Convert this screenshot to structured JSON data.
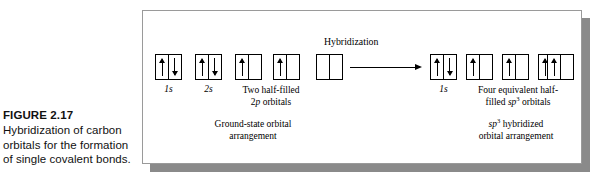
{
  "figure": {
    "number_label": "FIGURE 2.17",
    "caption_line1": "Hybridization of carbon",
    "caption_line2": "orbitals for the formation",
    "caption_line3": "of single covalent bonds."
  },
  "diagram": {
    "process_label": "Hybridization",
    "process_arrow": "right-arrow",
    "left_side": {
      "orbitals": [
        {
          "name": "1s-orbital",
          "label": "1s",
          "left_arrow": "up",
          "right_arrow": "down"
        },
        {
          "name": "2s-orbital",
          "label": "2s",
          "left_arrow": "up",
          "right_arrow": "down"
        },
        {
          "name": "2p-orbital-1",
          "label": "",
          "left_arrow": "up",
          "right_arrow": "none"
        },
        {
          "name": "2p-orbital-2",
          "label": "",
          "left_arrow": "up",
          "right_arrow": "none"
        },
        {
          "name": "2p-orbital-empty",
          "label": "",
          "left_arrow": "none",
          "right_arrow": "none"
        }
      ],
      "label_1s": "1s",
      "label_2s": "2s",
      "p_label_line1": "Two half-filled",
      "p_label_line2": "2p orbitals",
      "p_label_line2_prefix": "2",
      "p_label_line2_italic": "p",
      "p_label_line2_suffix": " orbitals",
      "state_line1": "Ground-state orbital",
      "state_line2": "arrangement"
    },
    "right_side": {
      "orbitals": [
        {
          "name": "1s-orbital",
          "label": "1s",
          "left_arrow": "up",
          "right_arrow": "down"
        },
        {
          "name": "sp3-orbital-1",
          "label": "",
          "left_arrow": "up",
          "right_arrow": "none"
        },
        {
          "name": "sp3-orbital-2",
          "label": "",
          "left_arrow": "up",
          "right_arrow": "none"
        },
        {
          "name": "sp3-orbital-3",
          "label": "",
          "left_arrow": "up",
          "right_arrow": "none"
        },
        {
          "name": "sp3-orbital-4",
          "label": "",
          "left_arrow": "up",
          "right_arrow": "none"
        }
      ],
      "label_1s": "1s",
      "sp3_label_line1": "Four equivalent half-",
      "sp3_label_line2_prefix": "filled ",
      "sp3_label_line2_italic": "sp",
      "sp3_label_line2_sup": "3",
      "sp3_label_line2_suffix": " orbitals",
      "state_line1_italic": "sp",
      "state_line1_sup": "3",
      "state_line1_suffix": " hybridized",
      "state_line2": "orbital arrangement"
    }
  },
  "colors": {
    "ink": "#000000",
    "panel_border": "#9a9a9a",
    "panel_shadow": "#8a8a8a",
    "background": "#ffffff"
  }
}
